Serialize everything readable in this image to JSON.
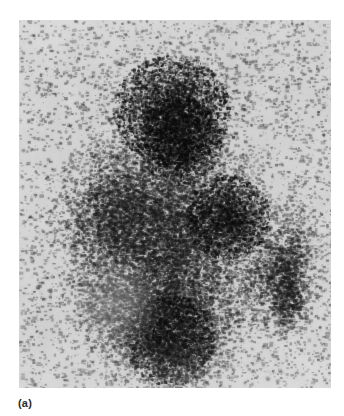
{
  "figure": {
    "caption_label": "(a)",
    "modality": "scintigram",
    "page_background": "#ffffff",
    "panel": {
      "background": "#d6d6d6",
      "left": 19,
      "top": 20,
      "width": 312,
      "height": 368,
      "speckle_dark_color": "#1a1a1a",
      "speckle_mid_color": "#555555",
      "noise_floor_color": "#c9c9c9"
    }
  },
  "chart_data": {
    "type": "heatmap",
    "title": "",
    "xlabel": "",
    "ylabel": "",
    "grid": false,
    "legend": null,
    "colormap": "grayscale-inverted",
    "axis_ranges": {
      "x": [
        0,
        312
      ],
      "y": [
        0,
        368
      ]
    },
    "annotations": [
      {
        "text": "(a)",
        "x": 18,
        "y": 396,
        "role": "figure-part-label"
      }
    ],
    "regions": [
      {
        "name": "superior-lobe",
        "comment": "upper pointed lobe of the main mass, high count density",
        "cx": 152,
        "cy": 90,
        "rx": 62,
        "ry": 58,
        "rotation": -8,
        "intensity": 0.8,
        "falloff": 1.35
      },
      {
        "name": "superior-hot-core",
        "comment": "darkest focus, upper centre",
        "cx": 160,
        "cy": 120,
        "rx": 44,
        "ry": 46,
        "rotation": -5,
        "intensity": 0.95,
        "falloff": 1.6
      },
      {
        "name": "left-lateral-lobe",
        "comment": "broad left wing of the diamond-shaped mass",
        "cx": 96,
        "cy": 195,
        "rx": 58,
        "ry": 72,
        "rotation": 12,
        "intensity": 0.66,
        "falloff": 1.2
      },
      {
        "name": "central-body",
        "comment": "main central body linking upper and lower poles",
        "cx": 150,
        "cy": 215,
        "rx": 85,
        "ry": 100,
        "rotation": 0,
        "intensity": 0.72,
        "falloff": 1.15
      },
      {
        "name": "right-mid-hot-core",
        "comment": "second dark focus, right of midline",
        "cx": 208,
        "cy": 196,
        "rx": 44,
        "ry": 44,
        "rotation": 0,
        "intensity": 0.92,
        "falloff": 1.5
      },
      {
        "name": "inferior-pole",
        "comment": "lower pole tapering toward bottom",
        "cx": 150,
        "cy": 300,
        "rx": 70,
        "ry": 72,
        "rotation": -4,
        "intensity": 0.78,
        "falloff": 1.25
      },
      {
        "name": "inferior-hot-core",
        "comment": "dark band low-centre",
        "cx": 150,
        "cy": 320,
        "rx": 48,
        "ry": 48,
        "rotation": 0,
        "intensity": 0.86,
        "falloff": 1.5
      },
      {
        "name": "lower-left-photopenic",
        "comment": "relatively cold / lighter zone lower-left",
        "cx": 95,
        "cy": 285,
        "rx": 44,
        "ry": 50,
        "rotation": 0,
        "intensity": 0.42,
        "falloff": 1.1
      },
      {
        "name": "satellite-focus",
        "comment": "separate vertically elongated uptake focus at right",
        "cx": 267,
        "cy": 248,
        "rx": 30,
        "ry": 66,
        "rotation": 6,
        "intensity": 0.62,
        "falloff": 1.25
      },
      {
        "name": "satellite-hot-core",
        "comment": "densest part of the satellite focus, lower half",
        "cx": 268,
        "cy": 278,
        "rx": 20,
        "ry": 34,
        "rotation": 4,
        "intensity": 0.78,
        "falloff": 1.6
      },
      {
        "name": "bridge-scatter",
        "comment": "faint scattered counts bridging main mass and satellite",
        "cx": 240,
        "cy": 250,
        "rx": 36,
        "ry": 60,
        "rotation": 0,
        "intensity": 0.22,
        "falloff": 1.0
      }
    ],
    "background_scatter": {
      "intensity": 0.045,
      "comment": "sparse background counts across the whole field"
    }
  }
}
